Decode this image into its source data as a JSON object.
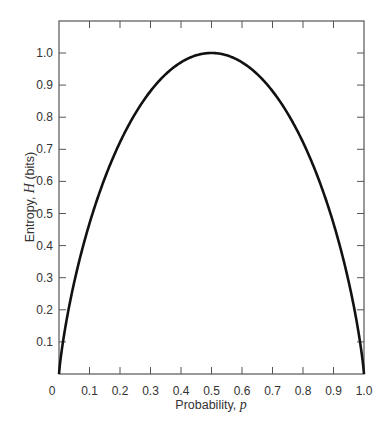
{
  "chart_data": {
    "type": "line",
    "title": "",
    "xlabel": "Probability, p",
    "xlabel_parts": {
      "text": "Probability, ",
      "var": "p"
    },
    "ylabel": "Entropy, H (bits)",
    "ylabel_parts": {
      "pre": "Entropy, ",
      "var": "H",
      "post": " (bits)"
    },
    "xlim": [
      0,
      1.0
    ],
    "ylim": [
      0,
      1.1
    ],
    "grid": false,
    "legend": null,
    "x_ticks": [
      "0",
      "0.1",
      "0.2",
      "0.3",
      "0.4",
      "0.5",
      "0.6",
      "0.7",
      "0.8",
      "0.9",
      "1.0"
    ],
    "y_ticks": [
      "0.1",
      "0.2",
      "0.3",
      "0.4",
      "0.5",
      "0.6",
      "0.7",
      "0.8",
      "0.9",
      "1.0"
    ],
    "series": [
      {
        "name": "Binary entropy H(p)",
        "x": [
          0,
          0.02,
          0.05,
          0.1,
          0.15,
          0.2,
          0.25,
          0.3,
          0.35,
          0.4,
          0.45,
          0.5,
          0.55,
          0.6,
          0.65,
          0.7,
          0.75,
          0.8,
          0.85,
          0.9,
          0.95,
          0.98,
          1.0
        ],
        "y": [
          0,
          0.141,
          0.286,
          0.469,
          0.61,
          0.722,
          0.811,
          0.881,
          0.934,
          0.971,
          0.993,
          1.0,
          0.993,
          0.971,
          0.934,
          0.881,
          0.811,
          0.722,
          0.61,
          0.469,
          0.286,
          0.141,
          0
        ],
        "color": "#111111"
      }
    ]
  },
  "colors": {
    "line": "#111111",
    "axis": "#555555",
    "text": "#333333"
  }
}
